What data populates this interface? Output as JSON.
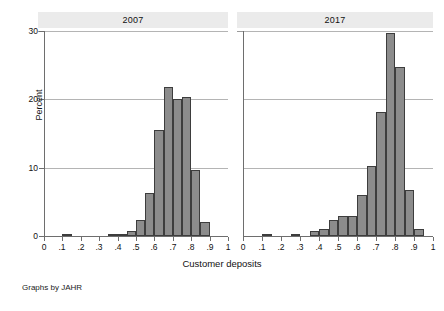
{
  "figure": {
    "note": "Graphs by JAHR",
    "ylabel": "Percent",
    "xlabel": "Customer deposits",
    "bar_fill": "#8c8c8c",
    "bar_outline": "#3d3d3d",
    "gridline_color": "#b4b4b4",
    "title_strip_color": "#ebebeb",
    "background": "#ffffff"
  },
  "chart_data": {
    "type": "bar",
    "subtype": "histogram",
    "title": "",
    "xlabel": "Customer deposits",
    "ylabel": "Percent",
    "note": "Graphs by JAHR",
    "grid": true,
    "grid_axis": "y",
    "legend": "none",
    "xlim": [
      0,
      1
    ],
    "ylim": [
      0,
      30
    ],
    "yticks": [
      0,
      10,
      20,
      30
    ],
    "ytick_labels": [
      "0",
      "10",
      "20",
      "30"
    ],
    "xticks": [
      0,
      0.1,
      0.2,
      0.3,
      0.4,
      0.5,
      0.6,
      0.7,
      0.8,
      0.9,
      1
    ],
    "xtick_labels": [
      "0",
      ".1",
      ".2",
      ".3",
      ".4",
      ".5",
      ".6",
      ".7",
      ".8",
      ".9",
      "1"
    ],
    "bin_width": 0.05,
    "panels": [
      {
        "title": "2007",
        "bins": [
          {
            "x0": 0.1,
            "value": 0.3
          },
          {
            "x0": 0.35,
            "value": 0.3
          },
          {
            "x0": 0.4,
            "value": 0.3
          },
          {
            "x0": 0.45,
            "value": 0.7
          },
          {
            "x0": 0.5,
            "value": 2.3
          },
          {
            "x0": 0.55,
            "value": 6.3
          },
          {
            "x0": 0.6,
            "value": 15.5
          },
          {
            "x0": 0.65,
            "value": 21.8
          },
          {
            "x0": 0.7,
            "value": 20.0
          },
          {
            "x0": 0.75,
            "value": 20.4
          },
          {
            "x0": 0.8,
            "value": 9.7
          },
          {
            "x0": 0.85,
            "value": 2.0
          }
        ]
      },
      {
        "title": "2017",
        "bins": [
          {
            "x0": 0.1,
            "value": 0.3
          },
          {
            "x0": 0.25,
            "value": 0.3
          },
          {
            "x0": 0.35,
            "value": 0.7
          },
          {
            "x0": 0.4,
            "value": 1.0
          },
          {
            "x0": 0.45,
            "value": 2.4
          },
          {
            "x0": 0.5,
            "value": 3.0
          },
          {
            "x0": 0.55,
            "value": 3.0
          },
          {
            "x0": 0.6,
            "value": 6.0
          },
          {
            "x0": 0.65,
            "value": 10.2
          },
          {
            "x0": 0.7,
            "value": 18.2
          },
          {
            "x0": 0.75,
            "value": 29.7
          },
          {
            "x0": 0.8,
            "value": 24.8
          },
          {
            "x0": 0.85,
            "value": 6.8
          },
          {
            "x0": 0.9,
            "value": 1.0
          }
        ]
      }
    ]
  }
}
